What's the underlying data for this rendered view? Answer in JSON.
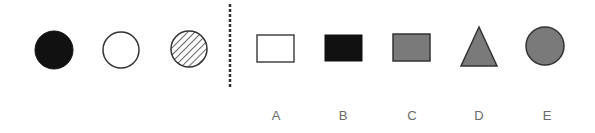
{
  "question": {
    "sequence": [
      {
        "shape": "circle",
        "fill": "black",
        "color": "#111111"
      },
      {
        "shape": "circle",
        "fill": "white",
        "color": "#ffffff"
      },
      {
        "shape": "circle",
        "fill": "hatched",
        "color": "#ffffff"
      }
    ],
    "separator": "dashed-vertical-line"
  },
  "options": [
    {
      "label": "A",
      "shape": "rectangle",
      "fill": "white",
      "color": "#ffffff"
    },
    {
      "label": "B",
      "shape": "rectangle",
      "fill": "black",
      "color": "#111111"
    },
    {
      "label": "C",
      "shape": "rectangle",
      "fill": "gray",
      "color": "#7a7a7a"
    },
    {
      "label": "D",
      "shape": "triangle",
      "fill": "gray",
      "color": "#7a7a7a"
    },
    {
      "label": "E",
      "shape": "circle",
      "fill": "gray",
      "color": "#7a7a7a"
    }
  ],
  "colors": {
    "stroke": "#333333",
    "label_text": "#6a6a6a",
    "separator": "#333333"
  }
}
